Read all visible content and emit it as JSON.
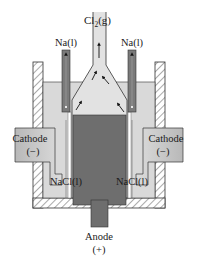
{
  "diagram": {
    "labels": {
      "chlorine_gas": "Cl",
      "chlorine_sub": "2",
      "chlorine_state": "(g)",
      "sodium_left": "Na(l)",
      "sodium_right": "Na(l)",
      "cathode_left": "Cathode",
      "cathode_left_sign": "(−)",
      "cathode_right": "Cathode",
      "cathode_right_sign": "(−)",
      "nacl_left": "NaCl(l)",
      "nacl_right": "NaCl(l)",
      "anode": "Anode",
      "anode_sign": "(+)"
    },
    "colors": {
      "bath": "#d9d9d9",
      "anode": "#6e6e6e",
      "cathode": "#c8c8c8",
      "tube": "#7a7a7a",
      "wall": "#ffffff",
      "outline": "#333333"
    }
  }
}
